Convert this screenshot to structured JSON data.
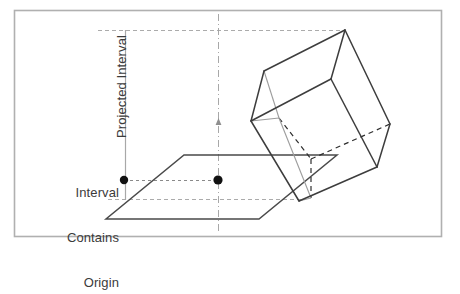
{
  "figure": {
    "labels": {
      "projected_interval": "Projected Interval",
      "interval_contains_origin_line1": "Interval",
      "interval_contains_origin_line2": "Contains",
      "interval_contains_origin_line3": "Origin"
    },
    "colors": {
      "frame": "#b0b0b0",
      "shape_stroke": "#4a4a4a",
      "guide_line": "#9a9a9a",
      "axis_line": "#a8a8a8",
      "dot_fill": "#111111",
      "text": "#3b3b3b",
      "background": "#ffffff"
    },
    "frame": {
      "x": 14,
      "y": 10,
      "width": 427,
      "height": 226
    },
    "axis": {
      "vertical_dashdot_x": 218,
      "vertical_dashdot_y1": 14,
      "vertical_dashdot_y2": 234,
      "arrow_tick_y": 122
    },
    "measure_axis": {
      "x": 125,
      "y_top": 30,
      "y_bottom": 200
    },
    "guides": [
      {
        "name": "top-projection-guide",
        "x1": 98,
        "y1": 30,
        "x2": 346,
        "y2": 30
      },
      {
        "name": "origin-interval-guide",
        "x1": 124,
        "y1": 180,
        "x2": 219,
        "y2": 180
      },
      {
        "name": "bottom-projection-guide",
        "x1": 108,
        "y1": 199,
        "x2": 301,
        "y2": 199
      }
    ],
    "dots": [
      {
        "name": "interval-endpoint-dot",
        "cx": 124,
        "cy": 180,
        "r": 4.2
      },
      {
        "name": "origin-dot",
        "cx": 218,
        "cy": 180,
        "r": 4.6
      }
    ],
    "plane": {
      "name": "separating-plane",
      "points": "184,155 337,155 259,219 106,219"
    },
    "cube": {
      "name": "oriented-bounding-box",
      "front_face": "251,121 264,71 345,30 390,124 377,167 299,201",
      "solid_edges": [
        {
          "x1": 251,
          "y1": 121,
          "x2": 264,
          "y2": 71
        },
        {
          "x1": 264,
          "y1": 71,
          "x2": 345,
          "y2": 30
        },
        {
          "x1": 345,
          "y1": 30,
          "x2": 390,
          "y2": 124
        },
        {
          "x1": 390,
          "y1": 124,
          "x2": 377,
          "y2": 167
        },
        {
          "x1": 377,
          "y1": 167,
          "x2": 299,
          "y2": 201
        },
        {
          "x1": 299,
          "y1": 201,
          "x2": 251,
          "y2": 121
        },
        {
          "x1": 251,
          "y1": 121,
          "x2": 331,
          "y2": 79
        },
        {
          "x1": 331,
          "y1": 79,
          "x2": 345,
          "y2": 30
        },
        {
          "x1": 331,
          "y1": 79,
          "x2": 376,
          "y2": 171
        }
      ],
      "light_edges": [
        {
          "x1": 264,
          "y1": 71,
          "x2": 279,
          "y2": 118
        },
        {
          "x1": 279,
          "y1": 118,
          "x2": 251,
          "y2": 121
        },
        {
          "x1": 279,
          "y1": 118,
          "x2": 311,
          "y2": 198
        },
        {
          "x1": 311,
          "y1": 198,
          "x2": 299,
          "y2": 201
        }
      ],
      "hidden_edges": [
        {
          "x1": 279,
          "y1": 118,
          "x2": 311,
          "y2": 159
        },
        {
          "x1": 311,
          "y1": 159,
          "x2": 311,
          "y2": 198
        },
        {
          "x1": 311,
          "y1": 159,
          "x2": 390,
          "y2": 124
        }
      ]
    }
  }
}
